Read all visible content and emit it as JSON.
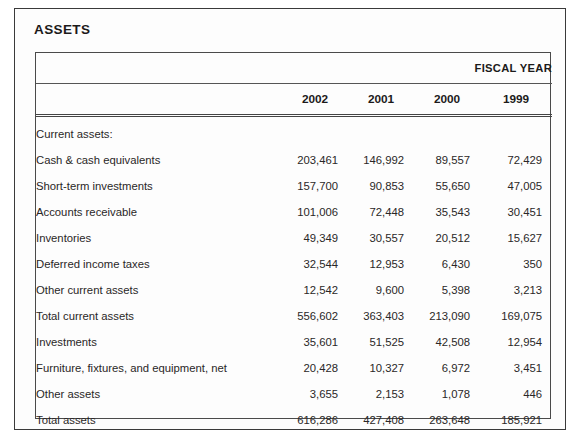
{
  "section": {
    "title": "ASSETS"
  },
  "table": {
    "fiscal_year_label": "FISCAL YEAR",
    "blank_header": "",
    "columns": [
      "2002",
      "2001",
      "2000",
      "1999"
    ],
    "rows": [
      {
        "label": "Current assets:",
        "indent": 0,
        "values": [
          "",
          "",
          "",
          ""
        ]
      },
      {
        "label": "Cash & cash equivalents",
        "indent": 1,
        "values": [
          "203,461",
          "146,992",
          "89,557",
          "72,429"
        ]
      },
      {
        "label": "Short-term investments",
        "indent": 1,
        "values": [
          "157,700",
          "90,853",
          "55,650",
          "47,005"
        ]
      },
      {
        "label": "Accounts receivable",
        "indent": 1,
        "values": [
          "101,006",
          "72,448",
          "35,543",
          "30,451"
        ]
      },
      {
        "label": "Inventories",
        "indent": 1,
        "values": [
          "49,349",
          "30,557",
          "20,512",
          "15,627"
        ]
      },
      {
        "label": "Deferred income taxes",
        "indent": 1,
        "values": [
          "32,544",
          "12,953",
          "6,430",
          "350"
        ]
      },
      {
        "label": "Other current assets",
        "indent": 1,
        "values": [
          "12,542",
          "9,600",
          "5,398",
          "3,213"
        ]
      },
      {
        "label": "Total current assets",
        "indent": 2,
        "values": [
          "556,602",
          "363,403",
          "213,090",
          "169,075"
        ]
      },
      {
        "label": "Investments",
        "indent": 0,
        "values": [
          "35,601",
          "51,525",
          "42,508",
          "12,954"
        ]
      },
      {
        "label": "Furniture, fixtures, and equipment, net",
        "indent": 0,
        "values": [
          "20,428",
          "10,327",
          "6,972",
          "3,451"
        ]
      },
      {
        "label": "Other assets",
        "indent": 0,
        "values": [
          "3,655",
          "2,153",
          "1,078",
          "446"
        ]
      },
      {
        "label": "Total assets",
        "indent": 2,
        "values": [
          "616,286",
          "427,408",
          "263,648",
          "185,921"
        ]
      }
    ]
  },
  "chart_data": {
    "type": "table",
    "title": "ASSETS",
    "categories": [
      "2002",
      "2001",
      "2000",
      "1999"
    ],
    "series": [
      {
        "name": "Cash & cash equivalents",
        "values": [
          203461,
          146992,
          89557,
          72429
        ]
      },
      {
        "name": "Short-term investments",
        "values": [
          157700,
          90853,
          55650,
          47005
        ]
      },
      {
        "name": "Accounts receivable",
        "values": [
          101006,
          72448,
          35543,
          30451
        ]
      },
      {
        "name": "Inventories",
        "values": [
          49349,
          30557,
          20512,
          15627
        ]
      },
      {
        "name": "Deferred income taxes",
        "values": [
          32544,
          12953,
          6430,
          350
        ]
      },
      {
        "name": "Other current assets",
        "values": [
          12542,
          9600,
          5398,
          3213
        ]
      },
      {
        "name": "Total current assets",
        "values": [
          556602,
          363403,
          213090,
          169075
        ]
      },
      {
        "name": "Investments",
        "values": [
          35601,
          51525,
          42508,
          12954
        ]
      },
      {
        "name": "Furniture, fixtures, and equipment, net",
        "values": [
          20428,
          10327,
          6972,
          3451
        ]
      },
      {
        "name": "Other assets",
        "values": [
          3655,
          2153,
          1078,
          446
        ]
      },
      {
        "name": "Total assets",
        "values": [
          616286,
          427408,
          263648,
          185921
        ]
      }
    ]
  }
}
